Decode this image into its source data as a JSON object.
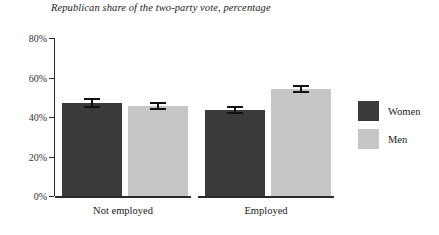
{
  "chart_data": {
    "type": "bar",
    "title": "Republican share of the two-party vote, percentage",
    "xlabel": "",
    "ylabel": "",
    "ylim": [
      0,
      80
    ],
    "yticks": [
      0,
      20,
      40,
      60,
      80
    ],
    "ytick_labels": [
      "0%",
      "20%",
      "40%",
      "60%",
      "80%"
    ],
    "grid": false,
    "legend_position": "right",
    "categories": [
      "Not employed",
      "Employed"
    ],
    "series": [
      {
        "name": "Women",
        "color": "#3a3a3a",
        "values": [
          47,
          43.5
        ],
        "errors": [
          2.0,
          1.5
        ]
      },
      {
        "name": "Men",
        "color": "#c6c6c6",
        "values": [
          45.5,
          54
        ],
        "errors": [
          1.5,
          1.5
        ]
      }
    ]
  },
  "legend": {
    "items": [
      {
        "label": "Women",
        "color": "#3a3a3a"
      },
      {
        "label": "Men",
        "color": "#c6c6c6"
      }
    ]
  },
  "axis": {
    "tick_labels": [
      "80%",
      "60%",
      "40%",
      "20%",
      "0%"
    ]
  },
  "groups": [
    {
      "label": "Not employed"
    },
    {
      "label": "Employed"
    }
  ]
}
